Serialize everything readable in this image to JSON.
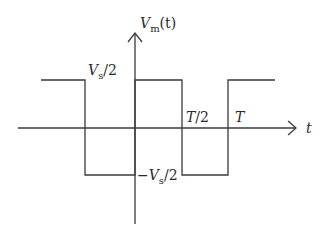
{
  "diagram": {
    "y_axis": {
      "symbol": "V",
      "subscript": "m",
      "argument": "(t)"
    },
    "x_axis": {
      "symbol": "t"
    },
    "labels": {
      "high": {
        "prefix": "",
        "symbol": "V",
        "subscript": "s",
        "suffix": "/2"
      },
      "low": {
        "prefix": "−",
        "symbol": "V",
        "subscript": "s",
        "suffix": "/2"
      },
      "half_period": {
        "symbol": "T",
        "suffix": "/2"
      },
      "period": {
        "symbol": "T"
      }
    },
    "waveform": {
      "type": "square",
      "levels": [
        "Vs/2",
        "-Vs/2"
      ],
      "transitions": [
        "-T/2",
        "0",
        "T/2",
        "T"
      ]
    },
    "colors": {
      "line": "#3a3a3a",
      "text": "#2a2a2a",
      "background": "#ffffff"
    }
  }
}
